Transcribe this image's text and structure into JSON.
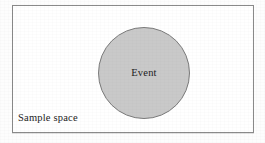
{
  "diagram": {
    "type": "venn-diagram",
    "sample_space": {
      "label": "Sample space",
      "shape": "rectangle",
      "fill_color": "#ffffff",
      "border_color": "#8a8a8a"
    },
    "event": {
      "label": "Event",
      "shape": "circle",
      "fill_color": "#c9c9c9",
      "border_color": "#7b7b7b"
    },
    "background_color": "#fdfdfd",
    "text_color": "#1c1c1c"
  }
}
